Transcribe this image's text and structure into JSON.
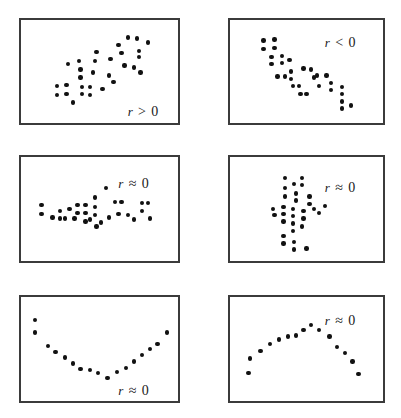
{
  "figure": {
    "width": 401,
    "height": 418,
    "background": "#ffffff",
    "dot_color": "#111111",
    "border_color": "#3b3b3b"
  },
  "chart_data": [
    {
      "type": "scatter",
      "id": "panel-1",
      "title": "",
      "annotation": "r > 0",
      "annotation_parts": {
        "var": "r",
        "op": ">",
        "val": "0"
      },
      "description": "Positive linear association, points rising left to right",
      "xlabel": "",
      "ylabel": "",
      "xlim": [
        0,
        100
      ],
      "ylim": [
        0,
        100
      ],
      "grid": false,
      "legend": "none",
      "points": [
        [
          23,
          36
        ],
        [
          23,
          27
        ],
        [
          29,
          37
        ],
        [
          29,
          28
        ],
        [
          33,
          20
        ],
        [
          30,
          57
        ],
        [
          37,
          60
        ],
        [
          38,
          52
        ],
        [
          38,
          44
        ],
        [
          39,
          35
        ],
        [
          39,
          28
        ],
        [
          44,
          35
        ],
        [
          44,
          27
        ],
        [
          46,
          49
        ],
        [
          47,
          60
        ],
        [
          48,
          69
        ],
        [
          52,
          33
        ],
        [
          56,
          46
        ],
        [
          57,
          62
        ],
        [
          59,
          40
        ],
        [
          62,
          76
        ],
        [
          64,
          68
        ],
        [
          66,
          56
        ],
        [
          68,
          83
        ],
        [
          72,
          54
        ],
        [
          74,
          82
        ],
        [
          75,
          70
        ],
        [
          75,
          64
        ],
        [
          81,
          78
        ],
        [
          76,
          49
        ]
      ]
    },
    {
      "type": "scatter",
      "id": "panel-2",
      "title": "",
      "annotation": "r < 0",
      "annotation_parts": {
        "var": "r",
        "op": "<",
        "val": "0"
      },
      "description": "Negative linear association, points falling left to right",
      "xlabel": "",
      "ylabel": "",
      "xlim": [
        0,
        100
      ],
      "ylim": [
        0,
        100
      ],
      "grid": false,
      "legend": "none",
      "points": [
        [
          22,
          80
        ],
        [
          22,
          72
        ],
        [
          29,
          81
        ],
        [
          29,
          73
        ],
        [
          27,
          64
        ],
        [
          27,
          57
        ],
        [
          34,
          65
        ],
        [
          34,
          58
        ],
        [
          39,
          61
        ],
        [
          31,
          45
        ],
        [
          36,
          45
        ],
        [
          40,
          50
        ],
        [
          40,
          43
        ],
        [
          41,
          36
        ],
        [
          45,
          36
        ],
        [
          48,
          53
        ],
        [
          53,
          52
        ],
        [
          55,
          44
        ],
        [
          58,
          36
        ],
        [
          57,
          46
        ],
        [
          63,
          46
        ],
        [
          66,
          39
        ],
        [
          66,
          32
        ],
        [
          73,
          35
        ],
        [
          73,
          28
        ],
        [
          73,
          21
        ],
        [
          73,
          14
        ],
        [
          79,
          17
        ],
        [
          46,
          28
        ],
        [
          50,
          28
        ]
      ]
    },
    {
      "type": "scatter",
      "id": "panel-3",
      "title": "",
      "annotation": "r ≈ 0",
      "annotation_parts": {
        "var": "r",
        "op": "≈",
        "val": "0"
      },
      "description": "No association, horizontal band of points",
      "xlabel": "",
      "ylabel": "",
      "xlim": [
        0,
        100
      ],
      "ylim": [
        0,
        100
      ],
      "grid": false,
      "legend": "none",
      "points": [
        [
          13,
          54
        ],
        [
          13,
          45
        ],
        [
          20,
          42
        ],
        [
          25,
          48
        ],
        [
          25,
          41
        ],
        [
          31,
          50
        ],
        [
          36,
          54
        ],
        [
          36,
          46
        ],
        [
          41,
          54
        ],
        [
          41,
          46
        ],
        [
          41,
          38
        ],
        [
          44,
          40
        ],
        [
          47,
          61
        ],
        [
          47,
          52
        ],
        [
          47,
          44
        ],
        [
          48,
          33
        ],
        [
          54,
          70
        ],
        [
          56,
          42
        ],
        [
          60,
          57
        ],
        [
          64,
          57
        ],
        [
          62,
          45
        ],
        [
          68,
          44
        ],
        [
          72,
          40
        ],
        [
          77,
          56
        ],
        [
          77,
          48
        ],
        [
          81,
          56
        ],
        [
          82,
          41
        ],
        [
          34,
          41
        ],
        [
          28,
          41
        ],
        [
          51,
          37
        ]
      ]
    },
    {
      "type": "scatter",
      "id": "panel-4",
      "title": "",
      "annotation": "r ≈ 0",
      "annotation_parts": {
        "var": "r",
        "op": "≈",
        "val": "0"
      },
      "description": "No association, vertical cluster of points",
      "xlabel": "",
      "ylabel": "",
      "xlim": [
        0,
        100
      ],
      "ylim": [
        0,
        100
      ],
      "grid": false,
      "legend": "none",
      "points": [
        [
          36,
          80
        ],
        [
          42,
          74
        ],
        [
          47,
          80
        ],
        [
          47,
          73
        ],
        [
          36,
          70
        ],
        [
          36,
          62
        ],
        [
          43,
          65
        ],
        [
          43,
          58
        ],
        [
          52,
          62
        ],
        [
          52,
          55
        ],
        [
          28,
          50
        ],
        [
          35,
          52
        ],
        [
          35,
          45
        ],
        [
          35,
          38
        ],
        [
          41,
          50
        ],
        [
          41,
          43
        ],
        [
          41,
          36
        ],
        [
          41,
          29
        ],
        [
          48,
          48
        ],
        [
          48,
          41
        ],
        [
          55,
          50
        ],
        [
          58,
          46
        ],
        [
          62,
          53
        ],
        [
          47,
          33
        ],
        [
          35,
          24
        ],
        [
          35,
          17
        ],
        [
          42,
          18
        ],
        [
          42,
          11
        ],
        [
          50,
          12
        ],
        [
          29,
          44
        ]
      ]
    },
    {
      "type": "scatter",
      "id": "panel-5",
      "title": "",
      "annotation": "r ≈ 0",
      "annotation_parts": {
        "var": "r",
        "op": "≈",
        "val": "0"
      },
      "description": "Curved U-shaped (quadratic) association with zero linear correlation",
      "xlabel": "",
      "ylabel": "",
      "xlim": [
        0,
        100
      ],
      "ylim": [
        0,
        100
      ],
      "grid": false,
      "legend": "none",
      "points": [
        [
          9,
          78
        ],
        [
          9,
          66
        ],
        [
          17,
          53
        ],
        [
          22,
          47
        ],
        [
          28,
          42
        ],
        [
          33,
          36
        ],
        [
          38,
          31
        ],
        [
          44,
          30
        ],
        [
          49,
          27
        ],
        [
          55,
          22
        ],
        [
          61,
          28
        ],
        [
          67,
          32
        ],
        [
          72,
          38
        ],
        [
          77,
          44
        ],
        [
          82,
          50
        ],
        [
          87,
          55
        ],
        [
          93,
          66
        ]
      ]
    },
    {
      "type": "scatter",
      "id": "panel-6",
      "title": "",
      "annotation": "r ≈ 0",
      "annotation_parts": {
        "var": "r",
        "op": "≈",
        "val": "0"
      },
      "description": "Curved inverted-U (arch) association with zero linear correlation",
      "xlabel": "",
      "ylabel": "",
      "xlim": [
        0,
        100
      ],
      "ylim": [
        0,
        100
      ],
      "grid": false,
      "legend": "none",
      "points": [
        [
          12,
          27
        ],
        [
          13,
          41
        ],
        [
          20,
          48
        ],
        [
          26,
          55
        ],
        [
          32,
          59
        ],
        [
          38,
          62
        ],
        [
          43,
          63
        ],
        [
          48,
          68
        ],
        [
          53,
          73
        ],
        [
          58,
          68
        ],
        [
          65,
          62
        ],
        [
          70,
          52
        ],
        [
          75,
          46
        ],
        [
          80,
          38
        ],
        [
          84,
          26
        ]
      ]
    }
  ],
  "panels": [
    {
      "label": "panel-1",
      "x": 19,
      "y": 18,
      "w": 161,
      "h": 107,
      "ann_x": 0.68,
      "ann_y": 0.82
    },
    {
      "label": "panel-2",
      "x": 228,
      "y": 18,
      "w": 157,
      "h": 107,
      "ann_x": 0.62,
      "ann_y": 0.15
    },
    {
      "label": "panel-3",
      "x": 19,
      "y": 155,
      "w": 161,
      "h": 108,
      "ann_x": 0.62,
      "ann_y": 0.18
    },
    {
      "label": "panel-4",
      "x": 228,
      "y": 155,
      "w": 157,
      "h": 108,
      "ann_x": 0.62,
      "ann_y": 0.22
    },
    {
      "label": "panel-5",
      "x": 19,
      "y": 295,
      "w": 161,
      "h": 108,
      "ann_x": 0.62,
      "ann_y": 0.83
    },
    {
      "label": "panel-6",
      "x": 228,
      "y": 295,
      "w": 157,
      "h": 108,
      "ann_x": 0.62,
      "ann_y": 0.15
    }
  ]
}
